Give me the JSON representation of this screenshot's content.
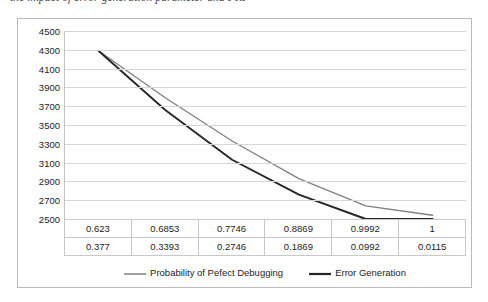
{
  "caption": "the impact of error generation parameter and FRF",
  "chart_data": {
    "type": "line",
    "title": "",
    "xlabel": "",
    "ylabel": "",
    "grid": true,
    "legend_position": "bottom",
    "ylim": [
      2500,
      4500
    ],
    "ytick_step": 200,
    "yticks": [
      4500,
      4300,
      4100,
      3900,
      3700,
      3500,
      3300,
      3100,
      2900,
      2700,
      2500
    ],
    "categories": [
      "1",
      "2",
      "3",
      "4",
      "5",
      "6"
    ],
    "series": [
      {
        "name": "Probability of Pefect Debugging",
        "color": "#808080",
        "values": [
          0.623,
          0.6853,
          0.7746,
          0.8869,
          0.9992,
          1
        ],
        "plot_values": [
          4290,
          3790,
          3330,
          2930,
          2640,
          2540
        ]
      },
      {
        "name": "Error Generation",
        "color": "#262626",
        "values": [
          0.377,
          0.3393,
          0.2746,
          0.1869,
          0.0992,
          0.0115
        ],
        "plot_values": [
          4290,
          3660,
          3130,
          2760,
          2500,
          2500
        ]
      }
    ],
    "table_rows": [
      [
        "0.623",
        "0.6853",
        "0.7746",
        "0.8869",
        "0.9992",
        "1"
      ],
      [
        "0.377",
        "0.3393",
        "0.2746",
        "0.1869",
        "0.0992",
        "0.0115"
      ]
    ]
  },
  "legend": {
    "entries": [
      {
        "label": "Probability of Pefect Debugging",
        "color": "#808080"
      },
      {
        "label": "Error Generation",
        "color": "#262626"
      }
    ]
  }
}
